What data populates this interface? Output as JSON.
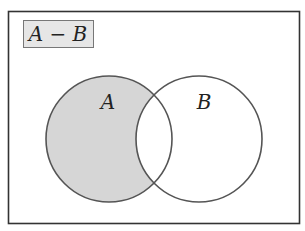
{
  "diagram": {
    "type": "venn",
    "title": "A − B",
    "sets": [
      {
        "name": "A",
        "label": "A",
        "shaded": true
      },
      {
        "name": "B",
        "label": "B",
        "shaded": false
      }
    ],
    "shaded_region": "A minus B",
    "colors": {
      "shade": "#d6d6d6",
      "stroke": "#555555",
      "title_box_fill": "#e6e6e6",
      "background": "#ffffff"
    }
  }
}
